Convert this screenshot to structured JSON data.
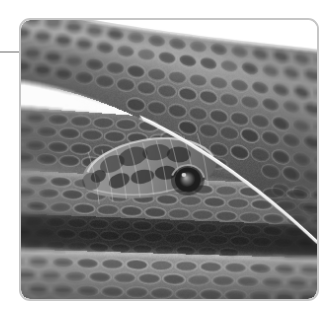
{
  "page": {
    "width": 335,
    "height": 317,
    "background_color": "#ffffff",
    "kind": "figure-plate"
  },
  "margin_rule": {
    "name": "horizontal-rule",
    "color": "#b4b4b4",
    "x": 0,
    "y": 51,
    "width": 22,
    "height": 2
  },
  "photo_frame": {
    "x": 19,
    "y": 18,
    "width": 300,
    "height": 283,
    "border_color": "#c6c6c6",
    "border_width": 2,
    "corner_radius": 11,
    "background_color": "#ffffff"
  },
  "photo": {
    "alt": "Close-up grayscale photograph of a coiled snake's head resting on its own body",
    "subject": "snake",
    "color_mode": "grayscale",
    "palette": {
      "background_white": "#ffffff",
      "scale_light": "#b9b9b9",
      "scale_mid": "#8e8e8e",
      "scale_dark": "#4a4a4a",
      "shadow_dark": "#2a2a2a",
      "eye_ring": "#1c1c1c",
      "eye_highlight": "#9a9a9a"
    },
    "regions": [
      {
        "name": "upper-left-white-wedge",
        "description": "white background visible in the top-left corner above the upper coil"
      },
      {
        "name": "upper-right-white-wedge",
        "description": "white background visible in the top-right area between the upper coil and the frame edge"
      },
      {
        "name": "upper-body-coil",
        "description": "diagonal band of scales sweeping from lower-left to upper-right across the top of the frame"
      },
      {
        "name": "snake-head",
        "description": "head in the left-of-centre of the frame with dark blotch markings and a large round eye",
        "center_x": 135,
        "center_y": 155
      },
      {
        "name": "snake-eye",
        "description": "large dark round eye with lighter central highlight",
        "center_x": 169,
        "center_y": 162,
        "radius": 13
      },
      {
        "name": "mid-body-coil",
        "description": "horizontal band of keeled scales running the full width below the head"
      },
      {
        "name": "dark-shadow-band",
        "description": "deep shadow band separating the middle and lower coils"
      },
      {
        "name": "lower-body-coil",
        "description": "lower horizontal coil with a pale highlight stripe and rows of scales"
      }
    ]
  }
}
